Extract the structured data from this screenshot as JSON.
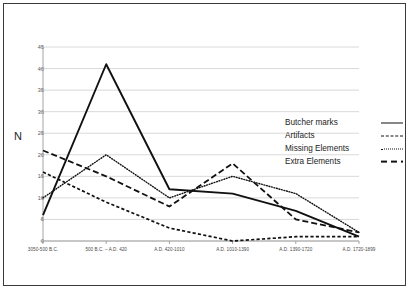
{
  "chart_data": {
    "type": "line",
    "title": "",
    "xlabel": "",
    "ylabel": "N",
    "ylim": [
      0,
      45
    ],
    "yticks": [
      0,
      5,
      10,
      15,
      20,
      25,
      30,
      35,
      40,
      45
    ],
    "grid": true,
    "legend_position": "right",
    "categories": [
      "3050-500 B.C.",
      "500 B.C. – A.D. 420",
      "A.D. 420-1010",
      "A.D. 1010-1390",
      "A.D. 1390-1720",
      "A.D. 1720-1899"
    ],
    "series": [
      {
        "name": "Butcher marks",
        "style": "solid",
        "values": [
          6,
          41,
          12,
          11,
          7,
          1
        ]
      },
      {
        "name": "Artifacts",
        "style": "shortdash",
        "values": [
          16,
          9,
          3,
          0,
          1,
          1
        ]
      },
      {
        "name": "Missing Elements",
        "style": "dotted",
        "values": [
          10,
          20,
          10,
          15,
          11,
          2
        ]
      },
      {
        "name": "Extra Elements",
        "style": "longdash",
        "values": [
          21,
          15,
          8,
          18,
          5,
          2
        ]
      }
    ]
  },
  "colors": {
    "line": "#111111",
    "grid": "#c9c9c9",
    "axis": "#9a9a9a",
    "frame": "#3b3b3b",
    "text": "#333333",
    "background": "#ffffff"
  },
  "legend": {
    "items": [
      {
        "label": "Butcher marks"
      },
      {
        "label": "Artifacts"
      },
      {
        "label": "Missing Elements"
      },
      {
        "label": "Extra Elements"
      }
    ]
  },
  "axis": {
    "y_title": "N"
  }
}
